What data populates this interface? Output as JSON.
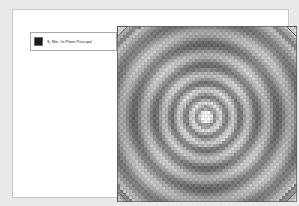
{
  "viewport": {
    "background_color": "#e9e9e9",
    "width": 299,
    "height": 206
  },
  "page": {
    "background_color": "#ffffff",
    "border_color": "#c9c9c9"
  },
  "legend": {
    "box_border_color": "#a8a8a8",
    "box_background": "#ffffff",
    "entries": [
      {
        "label": "S, Min. In-Plane Principal",
        "swatch_color": "#1c1c1c",
        "swatch_border_color": "#6e6e6e"
      }
    ]
  },
  "plot": {
    "name": "contour-plot",
    "mesh_line_color": "#8a8a8a",
    "contour_dark_color": "#4a4a4a",
    "contour_light_color": "#ffffff",
    "center_highlight_color": "#ffffff",
    "corner_marker_color": "#555555"
  },
  "chart_data": {
    "type": "heatmap",
    "title": "",
    "xlabel": "",
    "ylabel": "",
    "legend_position": "top-left",
    "grid": true,
    "field_name": "S, Min. In-Plane Principal",
    "mesh": {
      "shape": "square-plate",
      "columns": 60,
      "rows": 58,
      "left_px": 104,
      "top_px": 16,
      "width_px": 180,
      "height_px": 176
    },
    "singularity_center": {
      "x_px": 193,
      "y_px": 107
    },
    "radial_bands": [
      {
        "radius_px": 4,
        "intensity": 0.02
      },
      {
        "radius_px": 9,
        "intensity": 0.62
      },
      {
        "radius_px": 14,
        "intensity": 0.18
      },
      {
        "radius_px": 20,
        "intensity": 0.7
      },
      {
        "radius_px": 27,
        "intensity": 0.24
      },
      {
        "radius_px": 34,
        "intensity": 0.74
      },
      {
        "radius_px": 42,
        "intensity": 0.3
      },
      {
        "radius_px": 51,
        "intensity": 0.76
      },
      {
        "radius_px": 61,
        "intensity": 0.34
      },
      {
        "radius_px": 72,
        "intensity": 0.78
      },
      {
        "radius_px": 84,
        "intensity": 0.38
      },
      {
        "radius_px": 97,
        "intensity": 0.8
      },
      {
        "radius_px": 111,
        "intensity": 0.42
      }
    ],
    "corner_markers": [
      {
        "position": "top-left"
      },
      {
        "position": "top-right"
      },
      {
        "position": "bottom-left"
      },
      {
        "position": "bottom-right"
      }
    ]
  }
}
